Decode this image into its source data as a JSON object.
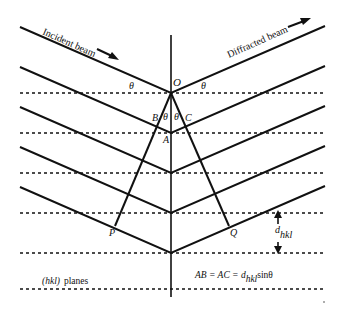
{
  "diagram": {
    "labels": {
      "incident": "Incident beam",
      "diffracted": "Diffracted beam",
      "O": "O",
      "A": "A",
      "B": "B",
      "C": "C",
      "P": "P",
      "Q": "Q",
      "theta": "θ",
      "d": "d",
      "d_sub": "hkl",
      "planes": "(hkl)",
      "planes_word": "planes",
      "eq_left": "AB = AC = d",
      "eq_sub": "hkl",
      "eq_right": "sinθ"
    },
    "colors": {
      "line": "#111111",
      "background": "#ffffff"
    }
  }
}
